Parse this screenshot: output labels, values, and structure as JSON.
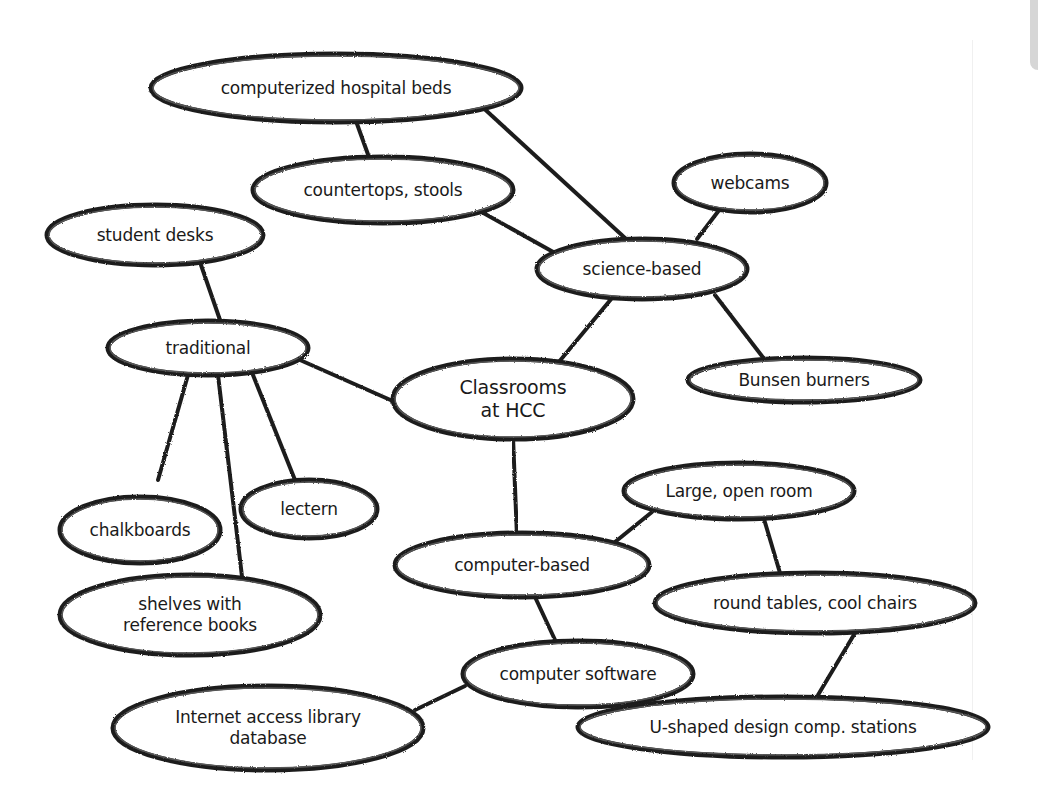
{
  "diagram": {
    "type": "concept-map",
    "root": "classrooms",
    "colors": {
      "stroke": "#1f1f1f",
      "text": "#1a1a1a",
      "background": "#ffffff",
      "edge_tab": "#d6d6d6"
    },
    "nodes": [
      {
        "id": "hospital_beds",
        "label": "computerized hospital beds",
        "cx": 336,
        "cy": 88,
        "rx": 185,
        "ry": 34
      },
      {
        "id": "countertops",
        "label": "countertops, stools",
        "cx": 383,
        "cy": 190,
        "rx": 130,
        "ry": 33
      },
      {
        "id": "webcams",
        "label": "webcams",
        "cx": 750,
        "cy": 183,
        "rx": 76,
        "ry": 29
      },
      {
        "id": "student_desks",
        "label": "student desks",
        "cx": 155,
        "cy": 235,
        "rx": 108,
        "ry": 30
      },
      {
        "id": "science_based",
        "label": "science-based",
        "cx": 642,
        "cy": 269,
        "rx": 105,
        "ry": 30
      },
      {
        "id": "traditional",
        "label": "traditional",
        "cx": 208,
        "cy": 348,
        "rx": 100,
        "ry": 27
      },
      {
        "id": "classrooms",
        "label": "Classrooms\nat HCC",
        "cx": 513,
        "cy": 399,
        "rx": 120,
        "ry": 40,
        "root": true
      },
      {
        "id": "bunsen",
        "label": "Bunsen burners",
        "cx": 804,
        "cy": 380,
        "rx": 116,
        "ry": 22
      },
      {
        "id": "large_room",
        "label": "Large, open room",
        "cx": 739,
        "cy": 491,
        "rx": 115,
        "ry": 28
      },
      {
        "id": "lectern",
        "label": "lectern",
        "cx": 309,
        "cy": 509,
        "rx": 68,
        "ry": 29
      },
      {
        "id": "chalkboards",
        "label": "chalkboards",
        "cx": 140,
        "cy": 530,
        "rx": 80,
        "ry": 33
      },
      {
        "id": "computer_based",
        "label": "computer-based",
        "cx": 522,
        "cy": 565,
        "rx": 127,
        "ry": 32
      },
      {
        "id": "round_tables",
        "label": "round tables, cool chairs",
        "cx": 815,
        "cy": 603,
        "rx": 160,
        "ry": 30
      },
      {
        "id": "shelves",
        "label": "shelves with\nreference books",
        "cx": 190,
        "cy": 615,
        "rx": 130,
        "ry": 40
      },
      {
        "id": "software",
        "label": "computer software",
        "cx": 578,
        "cy": 674,
        "rx": 115,
        "ry": 33
      },
      {
        "id": "internet",
        "label": "Internet access library\ndatabase",
        "cx": 268,
        "cy": 728,
        "rx": 155,
        "ry": 42
      },
      {
        "id": "u_shaped",
        "label": "U-shaped design comp. stations",
        "cx": 783,
        "cy": 727,
        "rx": 205,
        "ry": 30
      }
    ],
    "edges": [
      {
        "from": "hospital_beds",
        "to": "countertops",
        "x1": 352,
        "y1": 110,
        "x2": 370,
        "y2": 160
      },
      {
        "from": "hospital_beds",
        "to": "science_based",
        "x1": 478,
        "y1": 103,
        "x2": 625,
        "y2": 238
      },
      {
        "from": "countertops",
        "to": "science_based",
        "x1": 478,
        "y1": 210,
        "x2": 555,
        "y2": 253
      },
      {
        "from": "webcams",
        "to": "science_based",
        "x1": 733,
        "y1": 192,
        "x2": 697,
        "y2": 239
      },
      {
        "from": "student_desks",
        "to": "traditional",
        "x1": 201,
        "y1": 265,
        "x2": 220,
        "y2": 320
      },
      {
        "from": "science_based",
        "to": "classrooms",
        "x1": 612,
        "y1": 298,
        "x2": 558,
        "y2": 363
      },
      {
        "from": "science_based",
        "to": "bunsen",
        "x1": 715,
        "y1": 295,
        "x2": 765,
        "y2": 360
      },
      {
        "from": "traditional",
        "to": "classrooms",
        "x1": 300,
        "y1": 360,
        "x2": 395,
        "y2": 402
      },
      {
        "from": "traditional",
        "to": "chalkboards",
        "x1": 188,
        "y1": 375,
        "x2": 158,
        "y2": 480
      },
      {
        "from": "traditional",
        "to": "shelves",
        "x1": 218,
        "y1": 375,
        "x2": 243,
        "y2": 585
      },
      {
        "from": "traditional",
        "to": "lectern",
        "x1": 253,
        "y1": 375,
        "x2": 297,
        "y2": 485
      },
      {
        "from": "classrooms",
        "to": "computer_based",
        "x1": 513,
        "y1": 437,
        "x2": 517,
        "y2": 537
      },
      {
        "from": "large_room",
        "to": "computer_based",
        "x1": 652,
        "y1": 512,
        "x2": 615,
        "y2": 542
      },
      {
        "from": "large_room",
        "to": "round_tables",
        "x1": 764,
        "y1": 519,
        "x2": 780,
        "y2": 573
      },
      {
        "from": "computer_based",
        "to": "software",
        "x1": 535,
        "y1": 597,
        "x2": 556,
        "y2": 642
      },
      {
        "from": "software",
        "to": "internet",
        "x1": 465,
        "y1": 686,
        "x2": 415,
        "y2": 710
      },
      {
        "from": "round_tables",
        "to": "u_shaped",
        "x1": 855,
        "y1": 633,
        "x2": 818,
        "y2": 695
      }
    ]
  }
}
